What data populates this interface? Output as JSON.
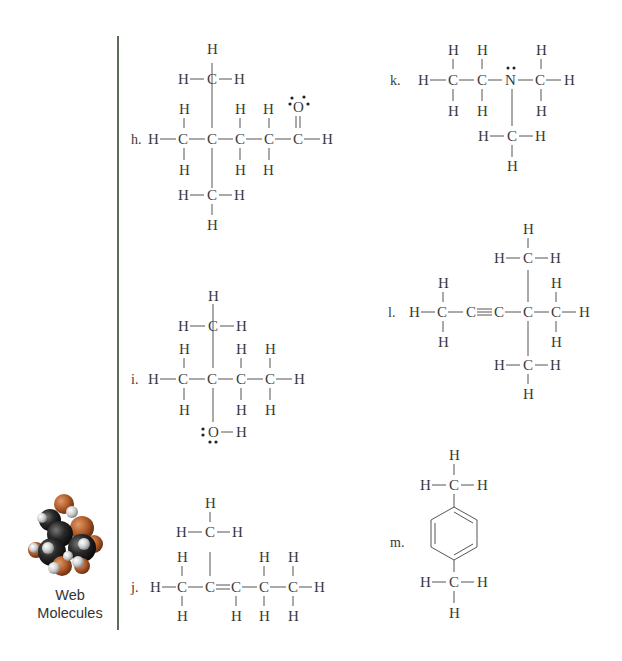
{
  "page": {
    "sidebar": {
      "logo_icon": "web-molecules-3d-icon",
      "label_line1": "Web",
      "label_line2": "Molecules",
      "colors": {
        "carbon": "#1e1e1e",
        "oxygen": "#b5622e",
        "hydrogen": "#d8d8d8"
      }
    },
    "divider_color": "#5d6b5a"
  },
  "structures": {
    "h": {
      "label": "h.",
      "formula": "3,3-dimethylbutanal",
      "atoms": {
        "C": "C",
        "H": "H",
        "O": "O"
      },
      "lone_pair_atom": "O"
    },
    "i": {
      "label": "i.",
      "formula": "2-methyl-2-butanol style alcohol",
      "atoms": {
        "C": "C",
        "H": "H",
        "O": "O"
      },
      "lone_pair_atom": "O"
    },
    "j": {
      "label": "j.",
      "formula": "2-methyl-2-pentene",
      "atoms": {
        "C": "C",
        "H": "H"
      }
    },
    "k": {
      "label": "k.",
      "formula": "N,N-dimethylethylamine",
      "atoms": {
        "C": "C",
        "H": "H",
        "N": "N"
      },
      "lone_pair_atom": "N"
    },
    "l": {
      "label": "l.",
      "formula": "4,4-dimethyl-2-hexyne",
      "atoms": {
        "C": "C",
        "H": "H"
      }
    },
    "m": {
      "label": "m.",
      "formula": "p-xylene",
      "atoms": {
        "C": "C",
        "H": "H"
      }
    }
  }
}
